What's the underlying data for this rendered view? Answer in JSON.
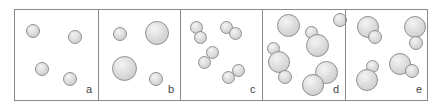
{
  "figure": {
    "colors": {
      "border": "#8a8a8a",
      "sphere_light": "#f4f4f4",
      "sphere_dark": "#c4c4c4",
      "sphere_outline": "#8e8e8e",
      "label": "#444444"
    },
    "panels": [
      {
        "label": "a",
        "x": 14,
        "w": 84,
        "balls": [
          {
            "cx": 33,
            "cy": 31,
            "d": 14
          },
          {
            "cx": 75,
            "cy": 37,
            "d": 14
          },
          {
            "cx": 42,
            "cy": 69,
            "d": 14
          },
          {
            "cx": 70,
            "cy": 79,
            "d": 14
          }
        ]
      },
      {
        "label": "b",
        "x": 98,
        "w": 82,
        "balls": [
          {
            "cx": 120,
            "cy": 34,
            "d": 14
          },
          {
            "cx": 157,
            "cy": 33,
            "d": 24
          },
          {
            "cx": 124,
            "cy": 68,
            "d": 25
          },
          {
            "cx": 156,
            "cy": 79,
            "d": 14
          }
        ]
      },
      {
        "label": "c",
        "x": 180,
        "w": 82,
        "balls": [
          {
            "cx": 196,
            "cy": 27,
            "d": 13
          },
          {
            "cx": 200,
            "cy": 37,
            "d": 13
          },
          {
            "cx": 226,
            "cy": 27,
            "d": 13
          },
          {
            "cx": 235,
            "cy": 33,
            "d": 13
          },
          {
            "cx": 212,
            "cy": 52,
            "d": 13
          },
          {
            "cx": 204,
            "cy": 62,
            "d": 13
          },
          {
            "cx": 238,
            "cy": 70,
            "d": 13
          },
          {
            "cx": 228,
            "cy": 77,
            "d": 13
          }
        ]
      },
      {
        "label": "d",
        "x": 262,
        "w": 83,
        "balls": [
          {
            "cx": 288,
            "cy": 25,
            "d": 23
          },
          {
            "cx": 340,
            "cy": 20,
            "d": 14
          },
          {
            "cx": 311,
            "cy": 32,
            "d": 13
          },
          {
            "cx": 317,
            "cy": 45,
            "d": 23
          },
          {
            "cx": 273,
            "cy": 48,
            "d": 13
          },
          {
            "cx": 279,
            "cy": 62,
            "d": 22
          },
          {
            "cx": 285,
            "cy": 77,
            "d": 14
          },
          {
            "cx": 326,
            "cy": 72,
            "d": 23
          },
          {
            "cx": 313,
            "cy": 85,
            "d": 22
          }
        ]
      },
      {
        "label": "e",
        "x": 345,
        "w": 83,
        "balls": [
          {
            "cx": 368,
            "cy": 27,
            "d": 22
          },
          {
            "cx": 375,
            "cy": 37,
            "d": 14
          },
          {
            "cx": 415,
            "cy": 27,
            "d": 22
          },
          {
            "cx": 416,
            "cy": 43,
            "d": 14
          },
          {
            "cx": 372,
            "cy": 66,
            "d": 13
          },
          {
            "cx": 367,
            "cy": 80,
            "d": 22
          },
          {
            "cx": 400,
            "cy": 64,
            "d": 22
          },
          {
            "cx": 412,
            "cy": 71,
            "d": 14
          }
        ]
      }
    ]
  }
}
